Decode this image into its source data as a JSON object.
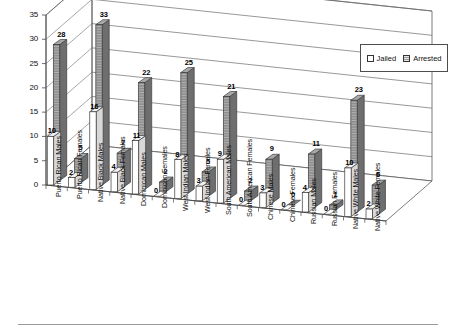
{
  "chart_data": {
    "type": "bar",
    "title": "",
    "subtitle": "",
    "xlabel": "",
    "ylabel": "",
    "ylim": [
      0,
      35
    ],
    "yticks": [
      0,
      5,
      10,
      15,
      20,
      25,
      30,
      35
    ],
    "grid": true,
    "three_d": true,
    "legend_position": "top-right",
    "categories": [
      "Puerto Rican Males",
      "Puerto Rican Females",
      "Native Black Males",
      "Native Black Females",
      "Dominican Males",
      "Dominican Females",
      "West Indian Males",
      "West Indian Females",
      "South American Males",
      "South American Females",
      "Chinese Males",
      "Chinese Females",
      "Russian Males",
      "Russian Females",
      "Native White Males",
      "Native White Females"
    ],
    "series": [
      {
        "name": "Jailed",
        "color": "#ffffff",
        "values": [
          10,
          2,
          16,
          4,
          11,
          0,
          8,
          3,
          9,
          0,
          3,
          0,
          4,
          0,
          10,
          2
        ]
      },
      {
        "name": "Arrested",
        "color": "#9a9a9a",
        "values": [
          28,
          5,
          33,
          7,
          22,
          2,
          25,
          5,
          21,
          2,
          9,
          0,
          11,
          1,
          23,
          6
        ]
      }
    ]
  },
  "legend": {
    "items": [
      {
        "label": "Jailed"
      },
      {
        "label": "Arrested"
      }
    ]
  },
  "axis": {
    "y_tick_labels": [
      "0",
      "5",
      "10",
      "15",
      "20",
      "25",
      "30",
      "35"
    ]
  }
}
